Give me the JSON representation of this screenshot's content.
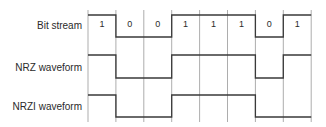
{
  "diagram": {
    "rows": [
      {
        "label": "Bit stream"
      },
      {
        "label": "NRZ waveform"
      },
      {
        "label": "NRZI waveform"
      }
    ],
    "bits": [
      "1",
      "0",
      "0",
      "1",
      "1",
      "1",
      "0",
      "1"
    ],
    "nrz_levels": [
      1,
      0,
      0,
      1,
      1,
      1,
      0,
      1
    ],
    "nrzi_levels": [
      1,
      0,
      0,
      1,
      1,
      1,
      0,
      0
    ],
    "colors": {
      "line": "#3a3a3a",
      "grid": "#8a8a8a"
    }
  }
}
